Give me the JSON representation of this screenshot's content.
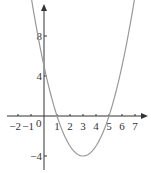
{
  "chart_data": {
    "type": "line",
    "title": "",
    "function": "y = x^2 - 6x + 5",
    "xlabel": "",
    "ylabel": "",
    "x_ticks": [
      "-2",
      "-1",
      "1",
      "2",
      "3",
      "4",
      "5",
      "6",
      "7"
    ],
    "y_ticks": [
      "8",
      "4",
      "-4"
    ],
    "origin_label": "0",
    "xlim": [
      -2.9,
      7.8
    ],
    "ylim": [
      -5.4,
      11.1
    ],
    "grid": false,
    "series": [
      {
        "name": "parabola",
        "x": [
          -0.95,
          0,
          1,
          2,
          3,
          4,
          5,
          6,
          6.95
        ],
        "y": [
          11.6,
          5,
          0,
          -3,
          -4,
          -3,
          0,
          5,
          11.6
        ]
      }
    ],
    "key_points": {
      "vertex": [
        3,
        -4
      ],
      "roots": [
        1,
        5
      ],
      "y_intercept": 5
    },
    "colors": {
      "axis": "#333333",
      "curve": "#999999"
    }
  }
}
